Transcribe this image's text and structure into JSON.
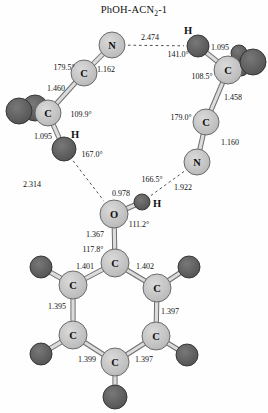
{
  "title": {
    "prefix": "PhOH-ACN",
    "sub": "2",
    "suffix": "-1"
  },
  "colors": {
    "background": "#fefefe",
    "light_atom_center": "#dadada",
    "light_atom_edge": "#b3b3b3",
    "light_atom_stroke": "#5f5f5f",
    "dark_atom_center": "#787878",
    "dark_atom_edge": "#4d4d4d",
    "dark_atom_stroke": "#2f2f2f",
    "bond_outer": "#6e6e6e",
    "bond_inner": "#dcdcdc",
    "hbond": "#3c3c3c",
    "text": "#111111"
  },
  "molecule": {
    "atoms": [
      {
        "id": "acn1-n",
        "el": "N",
        "x": 112,
        "y": 45,
        "r": 13,
        "shade": "light",
        "show": true
      },
      {
        "id": "acn1-c",
        "el": "C",
        "x": 84,
        "y": 73,
        "r": 13,
        "shade": "light",
        "show": true
      },
      {
        "id": "acn1-h-back",
        "el": "H",
        "x": 35,
        "y": 108,
        "r": 13,
        "shade": "dark",
        "show": false
      },
      {
        "id": "acn1-h-left",
        "el": "H",
        "x": 19,
        "y": 111,
        "r": 13,
        "shade": "dark",
        "show": false
      },
      {
        "id": "acn1-cme",
        "el": "C",
        "x": 48,
        "y": 113,
        "r": 13,
        "shade": "light",
        "show": true
      },
      {
        "id": "acn1-h-down",
        "el": "H",
        "x": 64,
        "y": 149,
        "r": 12,
        "shade": "dark",
        "show": false
      },
      {
        "id": "acn2-h-top",
        "el": "H",
        "x": 198,
        "y": 46,
        "r": 11,
        "shade": "dark",
        "show": false
      },
      {
        "id": "acn2-h-s1",
        "el": "H",
        "x": 239,
        "y": 53,
        "r": 8,
        "shade": "dark",
        "show": false
      },
      {
        "id": "acn2-h-s2",
        "el": "H",
        "x": 241,
        "y": 68,
        "r": 8,
        "shade": "dark",
        "show": false
      },
      {
        "id": "acn2-cme",
        "el": "C",
        "x": 228,
        "y": 70,
        "r": 14,
        "shade": "light",
        "show": true
      },
      {
        "id": "acn2-h-big",
        "el": "H",
        "x": 253,
        "y": 62,
        "r": 13,
        "shade": "dark",
        "show": false
      },
      {
        "id": "acn2-c",
        "el": "C",
        "x": 206,
        "y": 122,
        "r": 13,
        "shade": "light",
        "show": true
      },
      {
        "id": "acn2-n",
        "el": "N",
        "x": 197,
        "y": 162,
        "r": 13,
        "shade": "light",
        "show": true
      },
      {
        "id": "phenol-o",
        "el": "O",
        "x": 114,
        "y": 214,
        "r": 14,
        "shade": "light",
        "show": true
      },
      {
        "id": "phenol-h",
        "el": "H",
        "x": 142,
        "y": 202,
        "r": 8,
        "shade": "dark",
        "show": false
      },
      {
        "id": "ring-h2",
        "el": "H",
        "x": 189,
        "y": 267,
        "r": 11,
        "shade": "dark",
        "show": false
      },
      {
        "id": "ring-h3",
        "el": "H",
        "x": 187,
        "y": 355,
        "r": 11,
        "shade": "dark",
        "show": false
      },
      {
        "id": "ring-h4",
        "el": "H",
        "x": 115,
        "y": 397,
        "r": 12,
        "shade": "dark",
        "show": false
      },
      {
        "id": "ring-h5",
        "el": "H",
        "x": 41,
        "y": 354,
        "r": 11,
        "shade": "dark",
        "show": false
      },
      {
        "id": "ring-h6",
        "el": "H",
        "x": 41,
        "y": 267,
        "r": 11,
        "shade": "dark",
        "show": false
      },
      {
        "id": "ring-c1",
        "el": "C",
        "x": 115,
        "y": 263,
        "r": 14,
        "shade": "light",
        "show": true
      },
      {
        "id": "ring-c2",
        "el": "C",
        "x": 157,
        "y": 288,
        "r": 14,
        "shade": "light",
        "show": true
      },
      {
        "id": "ring-c3",
        "el": "C",
        "x": 156,
        "y": 336,
        "r": 14,
        "shade": "light",
        "show": true
      },
      {
        "id": "ring-c4",
        "el": "C",
        "x": 115,
        "y": 362,
        "r": 14,
        "shade": "light",
        "show": true
      },
      {
        "id": "ring-c5",
        "el": "C",
        "x": 73,
        "y": 335,
        "r": 14,
        "shade": "light",
        "show": true
      },
      {
        "id": "ring-c6",
        "el": "C",
        "x": 73,
        "y": 285,
        "r": 14,
        "shade": "light",
        "show": true
      }
    ],
    "bonds": [
      [
        "acn1-n",
        "acn1-c"
      ],
      [
        "acn1-c",
        "acn1-cme"
      ],
      [
        "acn1-cme",
        "acn1-h-down"
      ],
      [
        "acn2-h-top",
        "acn2-cme"
      ],
      [
        "acn2-cme",
        "acn2-c"
      ],
      [
        "acn2-c",
        "acn2-n"
      ],
      [
        "phenol-o",
        "phenol-h"
      ],
      [
        "phenol-o",
        "ring-c1"
      ],
      [
        "ring-c1",
        "ring-c2"
      ],
      [
        "ring-c2",
        "ring-c3"
      ],
      [
        "ring-c3",
        "ring-c4"
      ],
      [
        "ring-c4",
        "ring-c5"
      ],
      [
        "ring-c5",
        "ring-c6"
      ],
      [
        "ring-c6",
        "ring-c1"
      ],
      [
        "ring-c2",
        "ring-h2"
      ],
      [
        "ring-c3",
        "ring-h3"
      ],
      [
        "ring-c4",
        "ring-h4"
      ],
      [
        "ring-c5",
        "ring-h5"
      ],
      [
        "ring-c6",
        "ring-h6"
      ]
    ],
    "hbonds": [
      {
        "from": "acn1-n",
        "to": "acn2-h-top",
        "value": "2.474"
      },
      {
        "from": "acn1-h-down",
        "to": "phenol-o",
        "value": "2.314"
      },
      {
        "from": "acn2-n",
        "to": "phenol-h",
        "value": "1.922"
      }
    ],
    "labels": [
      {
        "text": "2.474",
        "x": 150,
        "y": 37,
        "kind": "distance"
      },
      {
        "text": "1.095",
        "x": 220,
        "y": 47,
        "kind": "distance"
      },
      {
        "text": "141.0°",
        "x": 178,
        "y": 54,
        "kind": "angle"
      },
      {
        "text": "179.5°",
        "x": 64,
        "y": 67,
        "kind": "angle"
      },
      {
        "text": "1.162",
        "x": 106,
        "y": 69,
        "kind": "angle_distance"
      },
      {
        "text": "108.5°",
        "x": 202,
        "y": 76,
        "kind": "angle"
      },
      {
        "text": "1.460",
        "x": 56,
        "y": 88,
        "kind": "distance"
      },
      {
        "text": "1.458",
        "x": 233,
        "y": 97,
        "kind": "distance"
      },
      {
        "text": "109.9°",
        "x": 81,
        "y": 114,
        "kind": "angle"
      },
      {
        "text": "179.0°",
        "x": 181,
        "y": 117,
        "kind": "angle"
      },
      {
        "text": "1.095",
        "x": 43,
        "y": 136,
        "kind": "distance"
      },
      {
        "text": "1.160",
        "x": 230,
        "y": 142,
        "kind": "distance"
      },
      {
        "text": "167.0°",
        "x": 92,
        "y": 154,
        "kind": "angle"
      },
      {
        "text": "166.5°",
        "x": 152,
        "y": 179,
        "kind": "angle"
      },
      {
        "text": "2.314",
        "x": 32,
        "y": 184,
        "kind": "distance"
      },
      {
        "text": "1.922",
        "x": 183,
        "y": 187,
        "kind": "distance"
      },
      {
        "text": "0.978",
        "x": 121,
        "y": 193,
        "kind": "distance"
      },
      {
        "text": "111.2°",
        "x": 139,
        "y": 224,
        "kind": "angle"
      },
      {
        "text": "1.367",
        "x": 95,
        "y": 234,
        "kind": "distance"
      },
      {
        "text": "117.8°",
        "x": 93,
        "y": 249,
        "kind": "angle"
      },
      {
        "text": "1.401",
        "x": 85,
        "y": 266,
        "kind": "distance"
      },
      {
        "text": "1.402",
        "x": 145,
        "y": 266,
        "kind": "distance"
      },
      {
        "text": "1.395",
        "x": 57,
        "y": 306,
        "kind": "distance"
      },
      {
        "text": "1.397",
        "x": 170,
        "y": 311,
        "kind": "distance"
      },
      {
        "text": "1.399",
        "x": 87,
        "y": 359,
        "kind": "distance"
      },
      {
        "text": "1.397",
        "x": 144,
        "y": 359,
        "kind": "distance"
      }
    ],
    "atom_text_labels": [
      {
        "text": "H",
        "x": 188,
        "y": 30,
        "for": "acn2-h-top"
      },
      {
        "text": "H",
        "x": 75,
        "y": 134,
        "for": "acn1-h-down"
      },
      {
        "text": "H",
        "x": 157,
        "y": 203,
        "for": "phenol-h"
      }
    ]
  }
}
